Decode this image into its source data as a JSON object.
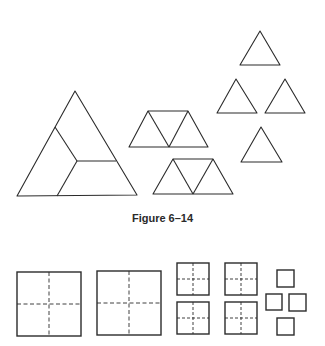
{
  "caption": "Figure 6–14",
  "colors": {
    "stroke": "#2b2b2b",
    "background": "#ffffff"
  },
  "triangle_group": {
    "large_triangle": {
      "outline": [
        [
          75,
          91
        ],
        [
          17,
          196
        ],
        [
          137,
          195
        ]
      ],
      "dividers": [
        [
          [
            55,
            127
          ],
          [
            77,
            161
          ]
        ],
        [
          [
            77,
            161
          ],
          [
            116,
            161
          ]
        ],
        [
          [
            77,
            161
          ],
          [
            57,
            196
          ]
        ]
      ]
    },
    "trapezoids": [
      {
        "top": [
          [
            148,
            111
          ],
          [
            188,
            111
          ]
        ],
        "bottom": [
          [
            129,
            147
          ],
          [
            208,
            147
          ]
        ],
        "mid": [
          169,
          147
        ]
      },
      {
        "top": [
          [
            173,
            159
          ],
          [
            213,
            159
          ]
        ],
        "bottom": [
          [
            153,
            194
          ],
          [
            233,
            194
          ]
        ],
        "mid": [
          193,
          194
        ]
      }
    ],
    "small_triangles": [
      {
        "apex": [
          260,
          31
        ],
        "base": [
          [
            240,
            65
          ],
          [
            280,
            65
          ]
        ]
      },
      {
        "apex": [
          236,
          79
        ],
        "base": [
          [
            217,
            113
          ],
          [
            257,
            113
          ]
        ]
      },
      {
        "apex": [
          285,
          79
        ],
        "base": [
          [
            265,
            113
          ],
          [
            305,
            113
          ]
        ]
      },
      {
        "apex": [
          261,
          127
        ],
        "base": [
          [
            241,
            162
          ],
          [
            282,
            162
          ]
        ]
      }
    ]
  },
  "square_group": {
    "large_squares": [
      {
        "x": 17,
        "y": 272,
        "size": 64,
        "dashed_quarters": true
      },
      {
        "x": 97,
        "y": 271,
        "size": 64,
        "dashed_quarters": true
      }
    ],
    "medium_squares": [
      {
        "x": 177,
        "y": 263,
        "size": 32,
        "dashed_quarters": true
      },
      {
        "x": 225,
        "y": 263,
        "size": 32,
        "dashed_quarters": true
      },
      {
        "x": 177,
        "y": 302,
        "size": 32,
        "dashed_quarters": true
      },
      {
        "x": 225,
        "y": 302,
        "size": 32,
        "dashed_quarters": true
      }
    ],
    "small_squares": [
      {
        "x": 277,
        "y": 270,
        "size": 17
      },
      {
        "x": 266,
        "y": 294,
        "size": 16
      },
      {
        "x": 289,
        "y": 294,
        "size": 17
      },
      {
        "x": 277,
        "y": 318,
        "size": 17
      }
    ]
  }
}
